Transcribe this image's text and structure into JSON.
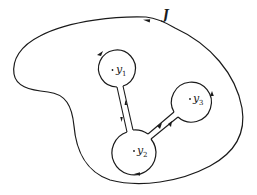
{
  "figure": {
    "contour_label": "J",
    "points": [
      {
        "name": "y1",
        "base": "y",
        "sub": "1"
      },
      {
        "name": "y2",
        "base": "y",
        "sub": "2"
      },
      {
        "name": "y3",
        "base": "y",
        "sub": "3"
      }
    ],
    "stroke_color": "#1a1a1a",
    "background": "#ffffff"
  }
}
